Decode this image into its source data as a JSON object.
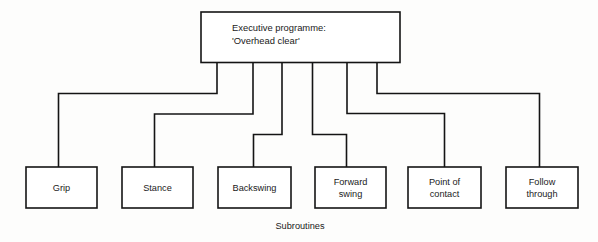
{
  "diagram": {
    "type": "hierarchical-flow-chart",
    "root": {
      "line1": "Executive programme:",
      "line2": "'Overhead clear'"
    },
    "caption": "Subroutines",
    "subroutines": [
      {
        "line1": "Grip",
        "line2": ""
      },
      {
        "line1": "Stance",
        "line2": ""
      },
      {
        "line1": "Backswing",
        "line2": ""
      },
      {
        "line1": "Forward",
        "line2": "swing"
      },
      {
        "line1": "Point of",
        "line2": "contact"
      },
      {
        "line1": "Follow",
        "line2": "through"
      }
    ],
    "colors": {
      "stroke": "#141414",
      "box_fill": "#ffffff",
      "background": "#fdfdfc",
      "text": "#1a1a1a"
    }
  }
}
